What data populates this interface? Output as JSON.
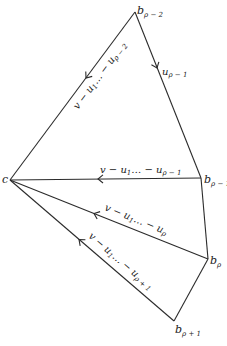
{
  "diagram": {
    "vertices": {
      "b_rho_minus_2": {
        "main": "b",
        "sub": "ρ − 2",
        "x": 135,
        "y": 12
      },
      "c": {
        "main": "c",
        "sub": "",
        "x": 10,
        "y": 180
      },
      "b_rho_minus_1": {
        "main": "b",
        "sub": "ρ − 1",
        "x": 201,
        "y": 178
      },
      "b_rho": {
        "main": "b",
        "sub": "ρ",
        "x": 208,
        "y": 259
      },
      "b_rho_plus_1": {
        "main": "b",
        "sub": "ρ + 1",
        "x": 174,
        "y": 321
      }
    },
    "edges": {
      "top_left": {
        "from": "b_rho_minus_2",
        "to": "c",
        "label": "v − u₁… − u_{ρ−2}",
        "main": "v − u",
        "s1": "1",
        "mid": "… − u",
        "s2": "ρ − 2"
      },
      "top_right": {
        "from": "b_rho_minus_2",
        "to": "b_rho_minus_1",
        "label": "u_{ρ−1}",
        "main": "u",
        "s1": "ρ − 1"
      },
      "middle": {
        "from": "b_rho_minus_1",
        "to": "c",
        "label": "v − u₁… − u_{ρ−1}",
        "main": "v − u",
        "s1": "1",
        "mid": "… − u",
        "s2": "ρ − 1"
      },
      "lower": {
        "from": "b_rho",
        "to": "c",
        "label": "v − u₁… − u_ρ",
        "main": "v − u",
        "s1": "1",
        "mid": "… − u",
        "s2": "ρ"
      },
      "bottom": {
        "from": "b_rho_plus_1",
        "to": "c",
        "label": "v − u₁… − u_{ρ+1}",
        "main": "v − u",
        "s1": "1",
        "mid": "… − u",
        "s2": "ρ + 1"
      },
      "right_1": {
        "from": "b_rho_minus_1",
        "to": "b_rho",
        "label": ""
      },
      "right_2": {
        "from": "b_rho",
        "to": "b_rho_plus_1",
        "label": ""
      }
    }
  }
}
